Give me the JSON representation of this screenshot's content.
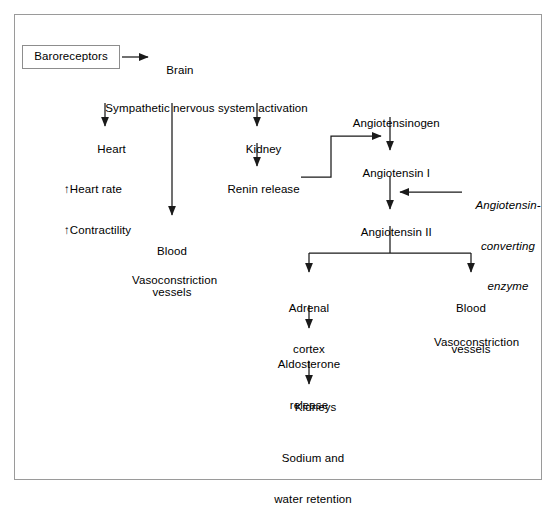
{
  "diagram": {
    "type": "flowchart",
    "frame_color": "#9a9a9a",
    "line_color": "#1a1a1a",
    "text_color": "#000000",
    "background": "#ffffff",
    "nodes": {
      "baroreceptors": "Baroreceptors",
      "brain": "Brain",
      "sympathetic": "Sympathetic nervous system activation",
      "heart": "Heart",
      "heart_effects_line1": "↑Heart rate",
      "heart_effects_line2": "↑Contractility",
      "blood_vessels_left_line1": "Blood",
      "blood_vessels_left_line2": "vessels",
      "vasoconstriction_left": "Vasoconstriction",
      "kidney": "Kidney",
      "renin_release": "Renin release",
      "angiotensinogen": "Angiotensinogen",
      "angiotensin_i": "Angiotensin I",
      "ace_line1": "Angiotensin-",
      "ace_line2": "converting",
      "ace_line3": "enzyme",
      "angiotensin_ii": "Angiotensin II",
      "adrenal_cortex_line1": "Adrenal",
      "adrenal_cortex_line2": "cortex",
      "aldosterone_line1": "Aldosterone",
      "aldosterone_line2": "release",
      "kidneys": "Kidneys",
      "sodium_water_line1": "Sodium and",
      "sodium_water_line2": "water retention",
      "blood_vessels_right_line1": "Blood",
      "blood_vessels_right_line2": "vessels",
      "vasoconstriction_right": "Vasoconstriction"
    }
  }
}
